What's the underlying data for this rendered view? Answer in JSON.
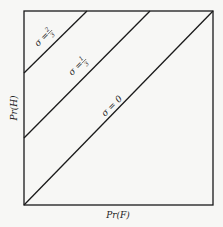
{
  "diagram": {
    "x_axis_label": "Pr(F)",
    "y_axis_label": "Pr(H)",
    "lines": [
      {
        "label_sym": "σ =",
        "label_val_num": "2",
        "label_val_den": "3",
        "sigma": "2/3"
      },
      {
        "label_sym": "σ =",
        "label_val_num": "1",
        "label_val_den": "3",
        "sigma": "1/3"
      },
      {
        "label_sym": "σ = 0",
        "sigma": "0"
      }
    ],
    "colors": {
      "line": "#1a1a1a",
      "background": "#f7f7f5"
    }
  }
}
